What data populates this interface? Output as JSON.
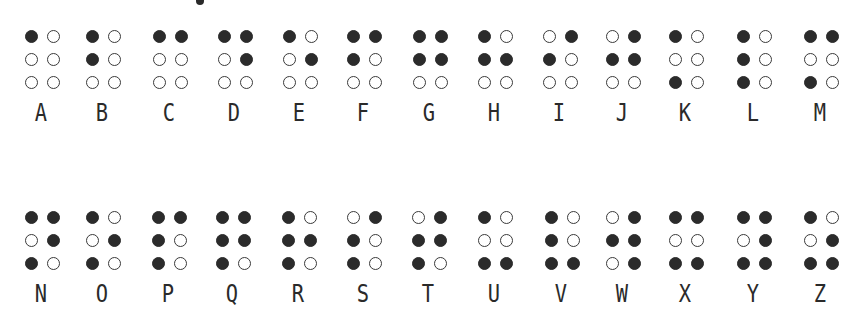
{
  "colors": {
    "filled_dot": "#2b2b2b",
    "empty_dot_border": "#3a3a3a",
    "background": "#ffffff",
    "letter": "#2a2a2a"
  },
  "legend": "Dot positions per cell: [1,4],[2,5],[3,6] — filled=1, empty=0",
  "rows": [
    {
      "cells": [
        {
          "letter": "A",
          "dots": [
            1,
            0,
            0,
            0,
            0,
            0
          ]
        },
        {
          "letter": "B",
          "dots": [
            1,
            0,
            1,
            0,
            0,
            0
          ]
        },
        {
          "letter": "C",
          "dots": [
            1,
            1,
            0,
            0,
            0,
            0
          ]
        },
        {
          "letter": "D",
          "dots": [
            1,
            1,
            0,
            1,
            0,
            0
          ]
        },
        {
          "letter": "E",
          "dots": [
            1,
            0,
            0,
            1,
            0,
            0
          ]
        },
        {
          "letter": "F",
          "dots": [
            1,
            1,
            1,
            0,
            0,
            0
          ]
        },
        {
          "letter": "G",
          "dots": [
            1,
            1,
            1,
            1,
            0,
            0
          ]
        },
        {
          "letter": "H",
          "dots": [
            1,
            0,
            1,
            1,
            0,
            0
          ]
        },
        {
          "letter": "I",
          "dots": [
            0,
            1,
            1,
            0,
            0,
            0
          ]
        },
        {
          "letter": "J",
          "dots": [
            0,
            1,
            1,
            1,
            0,
            0
          ]
        },
        {
          "letter": "K",
          "dots": [
            1,
            0,
            0,
            0,
            1,
            0
          ]
        },
        {
          "letter": "L",
          "dots": [
            1,
            0,
            1,
            0,
            1,
            0
          ]
        },
        {
          "letter": "M",
          "dots": [
            1,
            1,
            0,
            0,
            1,
            0
          ]
        }
      ]
    },
    {
      "cells": [
        {
          "letter": "N",
          "dots": [
            1,
            1,
            0,
            1,
            1,
            0
          ]
        },
        {
          "letter": "O",
          "dots": [
            1,
            0,
            0,
            1,
            1,
            0
          ]
        },
        {
          "letter": "P",
          "dots": [
            1,
            1,
            1,
            0,
            1,
            0
          ]
        },
        {
          "letter": "Q",
          "dots": [
            1,
            1,
            1,
            1,
            1,
            0
          ]
        },
        {
          "letter": "R",
          "dots": [
            1,
            0,
            1,
            1,
            1,
            0
          ]
        },
        {
          "letter": "S",
          "dots": [
            0,
            1,
            1,
            0,
            1,
            0
          ]
        },
        {
          "letter": "T",
          "dots": [
            0,
            1,
            1,
            1,
            1,
            0
          ]
        },
        {
          "letter": "U",
          "dots": [
            1,
            0,
            0,
            0,
            1,
            1
          ]
        },
        {
          "letter": "V",
          "dots": [
            1,
            0,
            1,
            0,
            1,
            1
          ]
        },
        {
          "letter": "W",
          "dots": [
            0,
            1,
            1,
            1,
            0,
            1
          ]
        },
        {
          "letter": "X",
          "dots": [
            1,
            1,
            0,
            0,
            1,
            1
          ]
        },
        {
          "letter": "Y",
          "dots": [
            1,
            1,
            0,
            1,
            1,
            1
          ]
        },
        {
          "letter": "Z",
          "dots": [
            1,
            0,
            0,
            1,
            1,
            1
          ]
        }
      ]
    }
  ]
}
